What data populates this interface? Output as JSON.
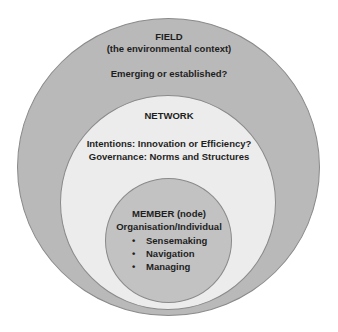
{
  "diagram": {
    "type": "nested-circles",
    "field": {
      "title": "FIELD",
      "subtitle": "(the environmental context)",
      "question": "Emerging or established?",
      "color": "#b9b9b9"
    },
    "network": {
      "title": "NETWORK",
      "line1": "Intentions: Innovation or Efficiency?",
      "line2": "Governance:  Norms and Structures",
      "color": "#ececec"
    },
    "member": {
      "title": "MEMBER (node)",
      "subtitle": "Organisation/Individual",
      "bullet_glyph": "•",
      "items": [
        "Sensemaking",
        "Navigation",
        "Managing"
      ],
      "color": "#c2c2c2"
    }
  }
}
